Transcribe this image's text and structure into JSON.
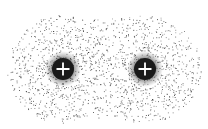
{
  "diagram": {
    "nuclei": [
      {
        "id": "nucleus-left",
        "cx": 63,
        "cy": 69,
        "r": 11,
        "charge_symbol": "+"
      },
      {
        "id": "nucleus-right",
        "cx": 145,
        "cy": 69,
        "r": 11,
        "charge_symbol": "+"
      }
    ],
    "cloud": {
      "lobe_radius_x": 56,
      "lobe_radius_y": 54,
      "waist_top": 18,
      "waist_bottom": 118,
      "dot_color": "#2a2a2a"
    },
    "colors": {
      "background": "#ffffff",
      "nucleus_fill": "#1a1a1a",
      "plus_color": "#ffffff"
    }
  }
}
